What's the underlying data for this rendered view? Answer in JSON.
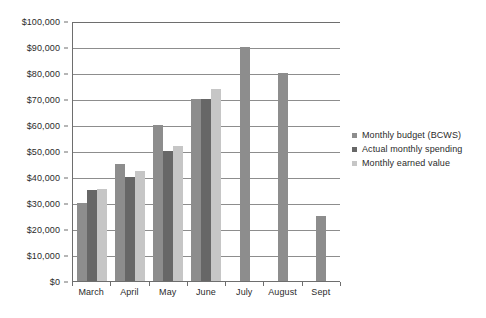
{
  "chart_data": {
    "type": "bar",
    "title": "",
    "subtitle": "",
    "xlabel": "",
    "ylabel": "",
    "categories": [
      "March",
      "April",
      "May",
      "June",
      "July",
      "August",
      "Sept"
    ],
    "series": [
      {
        "name": "Monthly budget (BCWS)",
        "color": "#8d8d8d",
        "values": [
          30000,
          45000,
          60000,
          70000,
          90000,
          80000,
          25000
        ]
      },
      {
        "name": "Actual monthly spending",
        "color": "#676767",
        "values": [
          35000,
          40000,
          50000,
          70000,
          null,
          null,
          null
        ]
      },
      {
        "name": "Monthly earned value",
        "color": "#c6c6c6",
        "values": [
          35500,
          42500,
          52000,
          74000,
          null,
          null,
          null
        ]
      }
    ],
    "ylim": [
      0,
      100000
    ],
    "y_ticks": [
      0,
      10000,
      20000,
      30000,
      40000,
      50000,
      60000,
      70000,
      80000,
      90000,
      100000
    ],
    "y_tick_labels": [
      "$0",
      "$10,000",
      "$20,000",
      "$30,000",
      "$40,000",
      "$50,000",
      "$60,000",
      "$70,000",
      "$80,000",
      "$90,000",
      "$100,000"
    ],
    "grid": true,
    "legend_position": "right",
    "legend_entries": [
      "Monthly budget (BCWS)",
      "Actual monthly spending",
      "Monthly earned value"
    ]
  }
}
